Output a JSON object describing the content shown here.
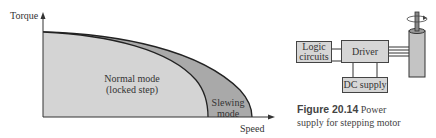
{
  "chart": {
    "y_axis_label": "Torque",
    "x_axis_label": "Speed",
    "regions": [
      {
        "label_line1": "Normal mode",
        "label_line2": "(locked step)",
        "fill": "#d4d4d4"
      },
      {
        "label_line1": "Slewing",
        "label_line2": "mode",
        "fill": "#a9a9a9"
      }
    ]
  },
  "diagram": {
    "blocks": {
      "logic": {
        "line1": "Logic",
        "line2": "circuits"
      },
      "driver": "Driver",
      "dc_supply": "DC supply"
    },
    "motor": "stepping-motor",
    "block_fill": "#d6d6d6"
  },
  "caption": {
    "number": "Figure 20.14",
    "text_line1": "Power",
    "text_line2": "supply for stepping motor"
  }
}
